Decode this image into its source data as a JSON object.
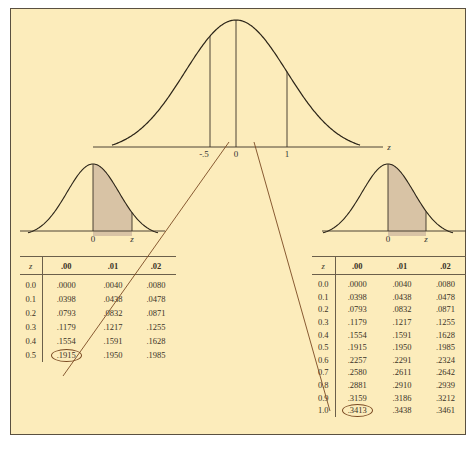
{
  "colors": {
    "background": "#fcecbb",
    "shading": "#d8c3a5",
    "curve": "#2b2418",
    "connector": "#7a4a22"
  },
  "main_curve": {
    "axis_label": "z",
    "tick_labels": [
      "-.5",
      "0",
      "1"
    ]
  },
  "left_curve": {
    "tick_labels": [
      "0",
      "z"
    ]
  },
  "right_curve": {
    "tick_labels": [
      "0",
      "z"
    ]
  },
  "left_table": {
    "headers": [
      "z",
      ".00",
      ".01",
      ".02"
    ],
    "rows": [
      [
        "0.0",
        ".0000",
        ".0040",
        ".0080"
      ],
      [
        "0.1",
        ".0398",
        ".0438",
        ".0478"
      ],
      [
        "0.2",
        ".0793",
        ".0832",
        ".0871"
      ],
      [
        "0.3",
        ".1179",
        ".1217",
        ".1255"
      ],
      [
        "0.4",
        ".1554",
        ".1591",
        ".1628"
      ],
      [
        "0.5",
        ".1915",
        ".1950",
        ".1985"
      ]
    ],
    "highlighted": ".1915"
  },
  "right_table": {
    "headers": [
      "z",
      ".00",
      ".01",
      ".02"
    ],
    "rows": [
      [
        "0.0",
        ".0000",
        ".0040",
        ".0080"
      ],
      [
        "0.1",
        ".0398",
        ".0438",
        ".0478"
      ],
      [
        "0.2",
        ".0793",
        ".0832",
        ".0871"
      ],
      [
        "0.3",
        ".1179",
        ".1217",
        ".1255"
      ],
      [
        "0.4",
        ".1554",
        ".1591",
        ".1628"
      ],
      [
        "0.5",
        ".1915",
        ".1950",
        ".1985"
      ],
      [
        "0.6",
        ".2257",
        ".2291",
        ".2324"
      ],
      [
        "0.7",
        ".2580",
        ".2611",
        ".2642"
      ],
      [
        "0.8",
        ".2881",
        ".2910",
        ".2939"
      ],
      [
        "0.9",
        ".3159",
        ".3186",
        ".3212"
      ],
      [
        "1.0",
        ".3413",
        ".3438",
        ".3461"
      ]
    ],
    "highlighted": ".3413"
  }
}
